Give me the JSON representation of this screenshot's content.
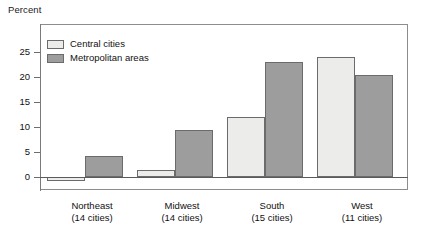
{
  "chart_data": {
    "type": "bar",
    "title": "",
    "ylabel": "Percent",
    "xlabel": "",
    "ylim": [
      -2.5,
      28
    ],
    "yticks": [
      0,
      5,
      10,
      15,
      20,
      25
    ],
    "ytick_labels": [
      "0",
      "5",
      "10",
      "15",
      "20",
      "25"
    ],
    "grid": false,
    "legend_position": "upper-left-inside",
    "categories": [
      "Northeast",
      "Midwest",
      "South",
      "West"
    ],
    "category_sublabels": [
      "(14 cities)",
      "(14 cities)",
      "(15 cities)",
      "(11 cities)"
    ],
    "series": [
      {
        "name": "Central cities",
        "color": "#ececeb",
        "values": [
          -0.7,
          1.4,
          12.0,
          24.0
        ]
      },
      {
        "name": "Metropolitan areas",
        "color": "#9d9d9d",
        "values": [
          4.2,
          9.5,
          23.0,
          20.5
        ]
      }
    ]
  },
  "axis": {
    "y_title": "Percent",
    "ticks": [
      {
        "label": "25"
      },
      {
        "label": "20"
      },
      {
        "label": "15"
      },
      {
        "label": "10"
      },
      {
        "label": "5"
      },
      {
        "label": "0"
      }
    ]
  },
  "legend": {
    "items": [
      {
        "label": "Central cities",
        "swatch": "light"
      },
      {
        "label": "Metropolitan areas",
        "swatch": "dark"
      }
    ]
  },
  "categories": [
    {
      "name": "Northeast",
      "sub": "(14 cities)"
    },
    {
      "name": "Midwest",
      "sub": "(14 cities)"
    },
    {
      "name": "South",
      "sub": "(15 cities)"
    },
    {
      "name": "West",
      "sub": "(11 cities)"
    }
  ],
  "colors": {
    "light_bar": "#ececeb",
    "dark_bar": "#9d9d9d",
    "bar_outline": "#6b6b6b",
    "frame": "#8d8d8d",
    "text": "#111111",
    "background": "#ffffff"
  }
}
